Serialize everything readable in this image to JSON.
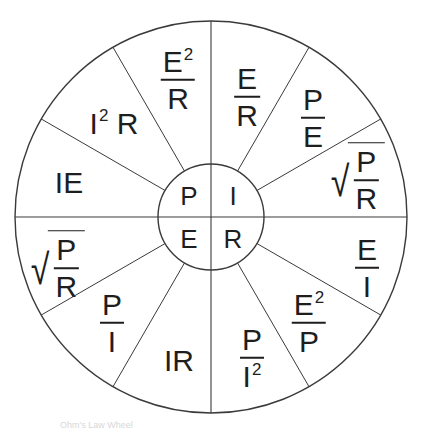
{
  "diagram": {
    "colors": {
      "line": "#3a3a3a",
      "text": "#1e1e1e",
      "background": "#ffffff"
    },
    "geometry": {
      "center": [
        211,
        217
      ],
      "outer_radius": 196,
      "inner_radius": 53,
      "sectors": 12
    },
    "inner": {
      "P": "P",
      "I": "I",
      "E": "E",
      "R": "R"
    },
    "outer": {
      "e2_over_r": {
        "num": "E",
        "num_sup": "2",
        "den": "R"
      },
      "e_over_r": {
        "num": "E",
        "den": "R"
      },
      "p_over_e": {
        "num": "P",
        "den": "E"
      },
      "sqrt_p_over_r_right": {
        "radical": "√",
        "num": "P",
        "den": "R"
      },
      "e_over_i": {
        "num": "E",
        "den": "I"
      },
      "e2_over_p": {
        "num": "E",
        "num_sup": "2",
        "den": "P"
      },
      "p_over_i2": {
        "num": "P",
        "den": "I",
        "den_sup": "2"
      },
      "ir": {
        "text": "IR"
      },
      "p_over_i": {
        "num": "P",
        "den": "I"
      },
      "sqrt_p_over_r_left": {
        "radical": "√",
        "num": "P",
        "den": "R"
      },
      "ie": {
        "text": "IE"
      },
      "i2r": {
        "base": "I",
        "sup": "2",
        "tail": " R"
      }
    },
    "footer_text": "Ohm's Law Wheel"
  }
}
